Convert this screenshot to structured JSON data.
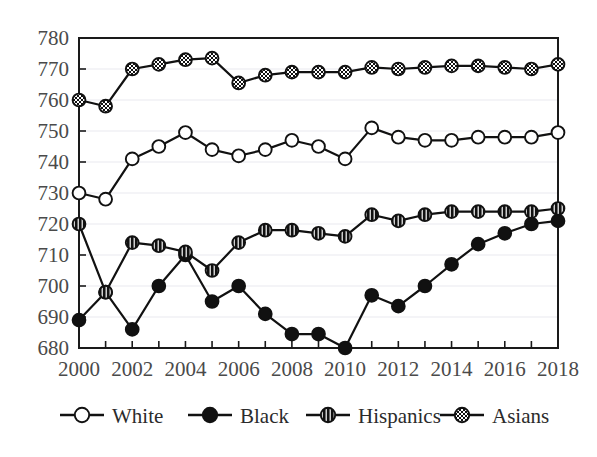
{
  "chart_data": {
    "type": "line",
    "title": "",
    "xlabel": "",
    "ylabel": "",
    "ylim": [
      680,
      780
    ],
    "xlim": [
      2000,
      2018
    ],
    "grid": true,
    "legend_position": "bottom",
    "ytick_labels": [
      "780",
      "770",
      "760",
      "750",
      "740",
      "730",
      "720",
      "710",
      "700",
      "690",
      "680"
    ],
    "ytick_values": [
      780,
      770,
      760,
      750,
      740,
      730,
      720,
      710,
      700,
      690,
      680
    ],
    "xtick_labels": [
      "2000",
      "2002",
      "2004",
      "2006",
      "2008",
      "2010",
      "2012",
      "2014",
      "2016",
      "2018"
    ],
    "xtick_values": [
      2000,
      2002,
      2004,
      2006,
      2008,
      2010,
      2012,
      2014,
      2016,
      2018
    ],
    "x": [
      2000,
      2001,
      2002,
      2003,
      2004,
      2005,
      2006,
      2007,
      2008,
      2009,
      2010,
      2011,
      2012,
      2013,
      2014,
      2015,
      2016,
      2017,
      2018
    ],
    "series": [
      {
        "name": "White",
        "marker": "open-circle",
        "values": [
          730,
          728,
          741,
          745,
          749.5,
          744,
          742,
          744,
          747,
          745,
          741,
          751,
          748,
          747,
          747,
          748,
          748,
          748,
          749.5
        ]
      },
      {
        "name": "Black",
        "marker": "filled-circle",
        "values": [
          689,
          698,
          686,
          700,
          710,
          695,
          700,
          691,
          684.5,
          684.5,
          680,
          697,
          693.5,
          700,
          707,
          713.5,
          717,
          720,
          721
        ]
      },
      {
        "name": "Hispanics",
        "marker": "vertical-stripe-circle",
        "values": [
          720,
          698,
          714,
          713,
          711,
          705,
          714,
          718,
          718,
          717,
          716,
          723,
          721,
          723,
          724,
          724,
          724,
          724,
          725
        ]
      },
      {
        "name": "Asians",
        "marker": "crosshatch-circle",
        "values": [
          760,
          758,
          770,
          771.5,
          773,
          773.5,
          765.5,
          768,
          769,
          769,
          769,
          770.5,
          770,
          770.5,
          771,
          771,
          770.5,
          770,
          771.5
        ]
      }
    ]
  },
  "legend": {
    "entries": [
      {
        "label": "White"
      },
      {
        "label": "Black"
      },
      {
        "label": "Hispanics"
      },
      {
        "label": "Asians"
      }
    ]
  },
  "colors": {
    "line": "#111111",
    "grid": "#e9e9ef",
    "axis": "#1a1a1a",
    "tick_text": "#4a4a4a",
    "background": "#ffffff"
  }
}
